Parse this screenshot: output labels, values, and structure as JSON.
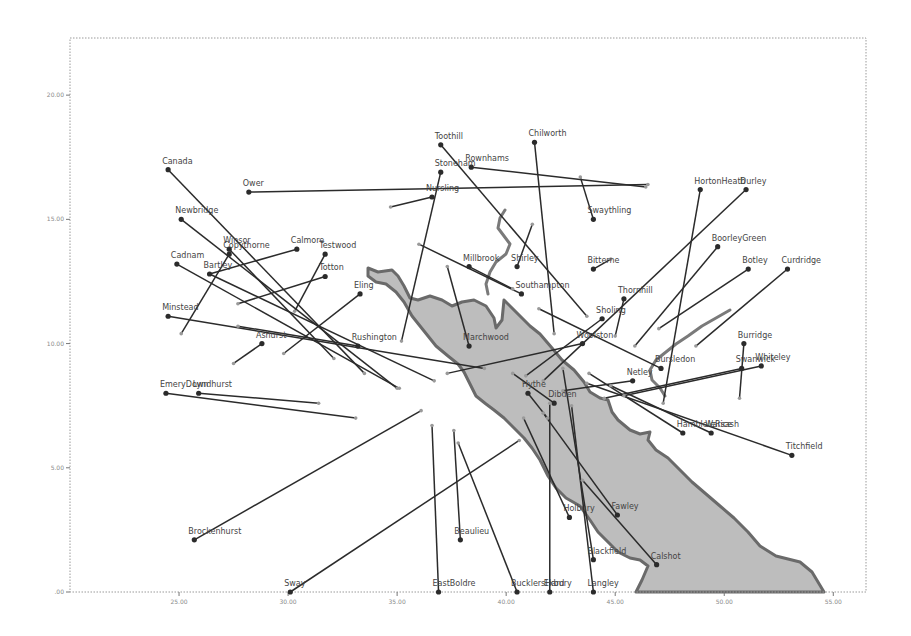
{
  "chart_data": {
    "type": "scatter",
    "title": "",
    "xlabel": "",
    "ylabel": "",
    "xlim": [
      20,
      56.5
    ],
    "ylim": [
      0,
      22.3
    ],
    "grid": false,
    "legend": null,
    "x_ticks": [
      {
        "value": 25,
        "label": "25.00"
      },
      {
        "value": 30,
        "label": "30.00"
      },
      {
        "value": 35,
        "label": "35.00"
      },
      {
        "value": 40,
        "label": "40.00"
      },
      {
        "value": 45,
        "label": "45.00"
      },
      {
        "value": 50,
        "label": "50.00"
      },
      {
        "value": 55,
        "label": "55.00"
      }
    ],
    "y_ticks": [
      {
        "value": 0,
        "label": ".00"
      },
      {
        "value": 5,
        "label": "5.00"
      },
      {
        "value": 10,
        "label": "10.00"
      },
      {
        "value": 15,
        "label": "15.00"
      },
      {
        "value": 20,
        "label": "20.00"
      }
    ],
    "points": [
      {
        "name": "Canada",
        "x": 24.5,
        "y": 17.0,
        "x2": 33.5,
        "y2": 8.8
      },
      {
        "name": "Newbridge",
        "x": 25.1,
        "y": 15.0,
        "x2": 35.0,
        "y2": 8.2
      },
      {
        "name": "Ower",
        "x": 28.2,
        "y": 16.1,
        "x2": 46.5,
        "y2": 16.4
      },
      {
        "name": "Toothill",
        "x": 37.0,
        "y": 18.0,
        "x2": 43.7,
        "y2": 11.1
      },
      {
        "name": "Chilworth",
        "x": 41.3,
        "y": 18.1,
        "x2": 42.2,
        "y2": 10.4
      },
      {
        "name": "Stoneham",
        "x": 37.0,
        "y": 16.9,
        "x2": 35.2,
        "y2": 10.1
      },
      {
        "name": "Rownhams",
        "x": 38.4,
        "y": 17.1,
        "x2": 46.4,
        "y2": 16.3
      },
      {
        "name": "Nursling",
        "x": 36.6,
        "y": 15.9,
        "x2": 34.7,
        "y2": 15.5
      },
      {
        "name": "Swaythling",
        "x": 44.0,
        "y": 15.0,
        "x2": 43.4,
        "y2": 16.7
      },
      {
        "name": "HortonHeath",
        "x": 48.9,
        "y": 16.2,
        "x2": 47.2,
        "y2": 7.6
      },
      {
        "name": "Durley",
        "x": 51.0,
        "y": 16.2,
        "x2": 41.7,
        "y2": 8.5
      },
      {
        "name": "BoorleyGreen",
        "x": 49.7,
        "y": 13.9,
        "x2": 45.9,
        "y2": 9.9
      },
      {
        "name": "Botley",
        "x": 51.1,
        "y": 13.0,
        "x2": 47.0,
        "y2": 10.6
      },
      {
        "name": "Curdridge",
        "x": 52.9,
        "y": 13.0,
        "x2": 48.7,
        "y2": 9.9
      },
      {
        "name": "Winsor",
        "x": 27.3,
        "y": 13.8,
        "x2": 32.1,
        "y2": 9.4
      },
      {
        "name": "Calmore",
        "x": 30.4,
        "y": 13.8,
        "x2": 26.4,
        "y2": 12.8
      },
      {
        "name": "Cadnam",
        "x": 24.9,
        "y": 13.2,
        "x2": 35.1,
        "y2": 8.2
      },
      {
        "name": "Copythorne",
        "x": 27.3,
        "y": 13.6,
        "x2": 25.1,
        "y2": 10.4
      },
      {
        "name": "Testwood",
        "x": 31.7,
        "y": 13.6,
        "x2": 30.3,
        "y2": 11.3
      },
      {
        "name": "Totton",
        "x": 31.7,
        "y": 12.7,
        "x2": 27.7,
        "y2": 11.6
      },
      {
        "name": "Bartley",
        "x": 26.4,
        "y": 12.8,
        "x2": 36.7,
        "y2": 8.5
      },
      {
        "name": "Eling",
        "x": 33.3,
        "y": 12.0,
        "x2": 29.8,
        "y2": 9.6
      },
      {
        "name": "Minstead",
        "x": 24.5,
        "y": 11.1,
        "x2": 39.0,
        "y2": 9.0
      },
      {
        "name": "Millbrook",
        "x": 38.3,
        "y": 13.1,
        "x2": 40.3,
        "y2": 12.2
      },
      {
        "name": "Shirley",
        "x": 40.5,
        "y": 13.1,
        "x2": 41.2,
        "y2": 14.8
      },
      {
        "name": "Bitterne",
        "x": 44.0,
        "y": 13.0,
        "x2": 44.8,
        "y2": 13.4
      },
      {
        "name": "Southampton",
        "x": 40.7,
        "y": 12.0,
        "x2": 36.0,
        "y2": 14.0
      },
      {
        "name": "Thornhill",
        "x": 45.4,
        "y": 11.8,
        "x2": 45.0,
        "y2": 10.3
      },
      {
        "name": "Sholing",
        "x": 44.4,
        "y": 11.0,
        "x2": 40.9,
        "y2": 8.7
      },
      {
        "name": "Woolston",
        "x": 43.5,
        "y": 10.0,
        "x2": 37.3,
        "y2": 8.8
      },
      {
        "name": "Ashurst",
        "x": 28.8,
        "y": 10.0,
        "x2": 27.5,
        "y2": 9.2
      },
      {
        "name": "Rushington",
        "x": 33.2,
        "y": 9.9,
        "x2": 27.7,
        "y2": 10.7
      },
      {
        "name": "Marchwood",
        "x": 38.3,
        "y": 9.9,
        "x2": 37.3,
        "y2": 13.1
      },
      {
        "name": "Hythe",
        "x": 41.0,
        "y": 8.0,
        "x2": 41.9,
        "y2": 7.0
      },
      {
        "name": "Dibden",
        "x": 42.2,
        "y": 7.6,
        "x2": 40.3,
        "y2": 8.8
      },
      {
        "name": "Netley",
        "x": 45.8,
        "y": 8.5,
        "x2": 42.6,
        "y2": 8.1
      },
      {
        "name": "Bursledon",
        "x": 47.1,
        "y": 9.0,
        "x2": 41.5,
        "y2": 11.4
      },
      {
        "name": "Burridge",
        "x": 50.9,
        "y": 10.0,
        "x2": 50.7,
        "y2": 7.8
      },
      {
        "name": "Swanwick",
        "x": 50.8,
        "y": 9.0,
        "x2": 44.5,
        "y2": 7.8
      },
      {
        "name": "Whiteley",
        "x": 51.7,
        "y": 9.1,
        "x2": 45.4,
        "y2": 7.9
      },
      {
        "name": "HambleleRice",
        "x": 48.1,
        "y": 6.4,
        "x2": 43.8,
        "y2": 8.8
      },
      {
        "name": "Warsash",
        "x": 49.4,
        "y": 6.4,
        "x2": 44.8,
        "y2": 8.3
      },
      {
        "name": "Titchfield",
        "x": 53.1,
        "y": 5.5,
        "x2": 43.7,
        "y2": 8.4
      },
      {
        "name": "EmeryDown",
        "x": 24.4,
        "y": 8.0,
        "x2": 33.1,
        "y2": 7.0
      },
      {
        "name": "Lyndhurst",
        "x": 25.9,
        "y": 8.0,
        "x2": 31.4,
        "y2": 7.6
      },
      {
        "name": "Brockenhurst",
        "x": 25.7,
        "y": 2.1,
        "x2": 36.1,
        "y2": 7.3
      },
      {
        "name": "Sway",
        "x": 30.1,
        "y": 0.0,
        "x2": 40.6,
        "y2": 6.1
      },
      {
        "name": "EastBoldre",
        "x": 36.9,
        "y": 0.0,
        "x2": 36.6,
        "y2": 6.7
      },
      {
        "name": "Beaulieu",
        "x": 37.9,
        "y": 2.1,
        "x2": 37.6,
        "y2": 6.5
      },
      {
        "name": "BucklersHard",
        "x": 40.5,
        "y": 0.0,
        "x2": 37.8,
        "y2": 6.0
      },
      {
        "name": "Exbury",
        "x": 42.0,
        "y": 0.0,
        "x2": 42.0,
        "y2": 7.6
      },
      {
        "name": "Holbury",
        "x": 42.9,
        "y": 3.0,
        "x2": 40.8,
        "y2": 7.0
      },
      {
        "name": "Fawley",
        "x": 45.1,
        "y": 3.1,
        "x2": 41.7,
        "y2": 7.2
      },
      {
        "name": "Blackfield",
        "x": 44.0,
        "y": 1.3,
        "x2": 42.6,
        "y2": 9.0
      },
      {
        "name": "Langley",
        "x": 44.0,
        "y": 0.0,
        "x2": 43.0,
        "y2": 7.5
      },
      {
        "name": "Calshot",
        "x": 46.9,
        "y": 1.1,
        "x2": 43.5,
        "y2": 4.5
      }
    ]
  }
}
